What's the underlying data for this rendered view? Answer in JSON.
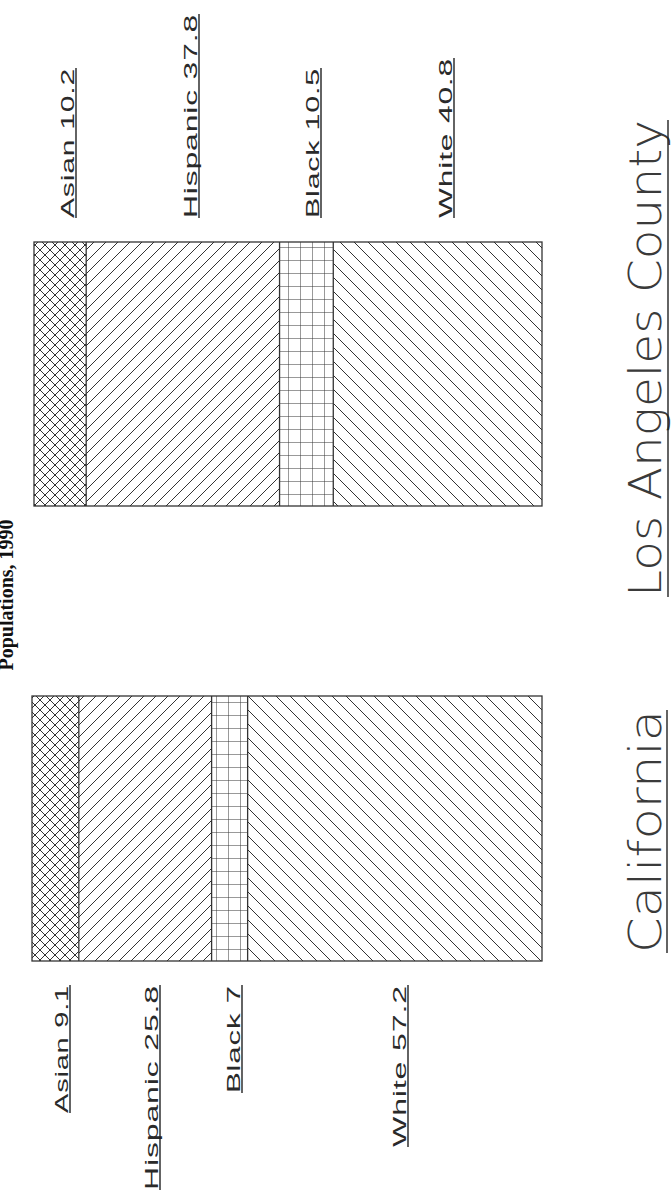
{
  "chart_data": {
    "type": "bar",
    "subtype": "stacked-100-percent",
    "orientation": "rotated-90-ccw",
    "title": "Populations, 1990",
    "xlabel": "",
    "ylabel": "",
    "grid": false,
    "legend": "none (inline segment labels)",
    "categories": [
      "Los Angeles County",
      "California"
    ],
    "series": [
      {
        "name": "Asian",
        "pattern": "crosshatch",
        "values": [
          10.2,
          9.1
        ]
      },
      {
        "name": "Hispanic",
        "pattern": "diagonal-forward",
        "values": [
          37.8,
          25.8
        ]
      },
      {
        "name": "Black",
        "pattern": "grid",
        "values": [
          10.5,
          7
        ]
      },
      {
        "name": "White",
        "pattern": "diagonal-back",
        "values": [
          40.8,
          57.2
        ]
      }
    ],
    "bars": [
      {
        "name": "Los Angeles County",
        "segments": [
          {
            "label": "Asian 10.2",
            "group": "Asian",
            "value": 10.2,
            "pattern": "crosshatch"
          },
          {
            "label": "Hispanic 37.8",
            "group": "Hispanic",
            "value": 37.8,
            "pattern": "slash"
          },
          {
            "label": "Black 10.5",
            "group": "Black",
            "value": 10.5,
            "pattern": "grid"
          },
          {
            "label": "White 40.8",
            "group": "White",
            "value": 40.8,
            "pattern": "backslash"
          }
        ]
      },
      {
        "name": "California",
        "segments": [
          {
            "label": "Asian 9.1",
            "group": "Asian",
            "value": 9.1,
            "pattern": "crosshatch"
          },
          {
            "label": "Hispanic 25.8",
            "group": "Hispanic",
            "value": 25.8,
            "pattern": "slash"
          },
          {
            "label": "Black 7",
            "group": "Black",
            "value": 7,
            "pattern": "grid"
          },
          {
            "label": "White 57.2",
            "group": "White",
            "value": 57.2,
            "pattern": "backslash"
          }
        ]
      }
    ]
  },
  "labels": {
    "title": "Populations, 1990",
    "la_name": "Los Angeles County",
    "ca_name": "California"
  },
  "colors": {
    "ink": "#333333",
    "background": "#ffffff"
  }
}
